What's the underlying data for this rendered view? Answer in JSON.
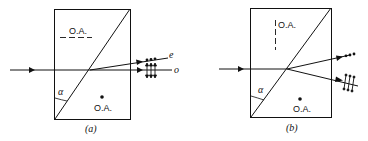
{
  "figure": {
    "panels": [
      {
        "id": "a",
        "caption": "(a)",
        "optic_axis_top_label": "O.A.",
        "optic_axis_top_orientation": "horizontal-dashed",
        "optic_axis_bottom_label": "O.A.",
        "optic_axis_bottom_orientation": "dot-out-of-page",
        "angle_label": "α",
        "ray_labels": {
          "upper": "e",
          "lower": "o"
        }
      },
      {
        "id": "b",
        "caption": "(b)",
        "optic_axis_top_label": "O.A.",
        "optic_axis_top_orientation": "vertical-dashed",
        "optic_axis_bottom_label": "O.A.",
        "optic_axis_bottom_orientation": "dot-out-of-page",
        "angle_label": "α"
      }
    ],
    "colors": {
      "ink": "#111111",
      "background": "#ffffff"
    }
  }
}
